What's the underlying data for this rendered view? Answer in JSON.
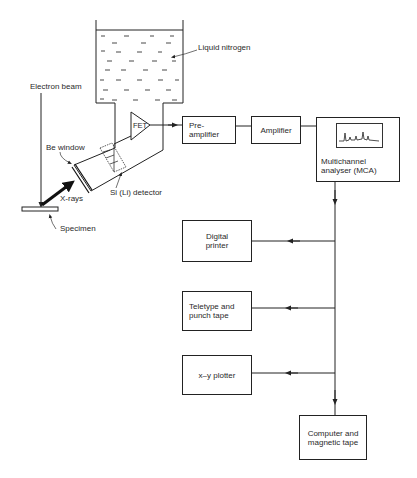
{
  "figure": {
    "type": "block-diagram"
  },
  "labels": {
    "liquid_nitrogen": "Liquid nitrogen",
    "electron_beam": "Electron beam",
    "be_window": "Be window",
    "fet": "FET",
    "si_li_detector": "Si (Li) detector",
    "x_rays": "X-rays",
    "specimen": "Specimen"
  },
  "blocks": {
    "preamplifier": {
      "line1": "Pre-",
      "line2": "amplifier"
    },
    "amplifier": {
      "label": "Amplifier"
    },
    "mca": {
      "line1": "Multichannel",
      "line2": "analyser (MCA)"
    },
    "digital_printer": {
      "line1": "Digital",
      "line2": "printer"
    },
    "teletype": {
      "line1": "Teletype and",
      "line2": "punch tape"
    },
    "xy_plotter": {
      "label": "x–y plotter"
    },
    "computer": {
      "line1": "Computer and",
      "line2": "magnetic tape"
    }
  },
  "connections": [
    {
      "from": "FET",
      "to": "Pre-amplifier"
    },
    {
      "from": "Pre-amplifier",
      "to": "Amplifier"
    },
    {
      "from": "Amplifier",
      "to": "Multichannel analyser (MCA)"
    },
    {
      "from": "Multichannel analyser (MCA)",
      "to": "Digital printer"
    },
    {
      "from": "Multichannel analyser (MCA)",
      "to": "Teletype and punch tape"
    },
    {
      "from": "Multichannel analyser (MCA)",
      "to": "x–y plotter"
    },
    {
      "from": "Multichannel analyser (MCA)",
      "to": "Computer and magnetic tape"
    }
  ],
  "colors": {
    "ink": "#222222",
    "background": "#ffffff"
  }
}
